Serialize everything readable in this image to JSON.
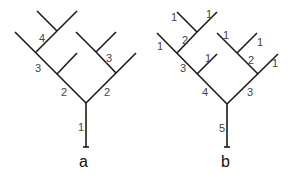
{
  "diagram": {
    "type": "binary tree comparison",
    "trees": [
      {
        "caption": "a",
        "labels": {
          "root": "1",
          "left_lower": "2",
          "right_lower": "2",
          "left_middle": "3",
          "right_upper": "3",
          "left_top": "4"
        }
      },
      {
        "caption": "b",
        "labels": {
          "root": "5",
          "left_lower": "4",
          "right_lower": "3",
          "left_middle": "3",
          "left_top": "2",
          "right_upper": "2",
          "leaf_top_left_outer": "1",
          "leaf_top_left_a": "1",
          "leaf_top_left_b": "1",
          "leaf_left_mid": "1",
          "leaf_right_a": "1",
          "leaf_right_b": "1",
          "leaf_right_outer": "1"
        }
      }
    ]
  }
}
